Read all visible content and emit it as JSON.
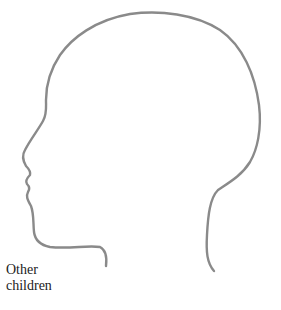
{
  "figure": {
    "label_lines": [
      "Other",
      "children"
    ],
    "stroke_color": "#8a8a8a",
    "background": "#ffffff"
  }
}
